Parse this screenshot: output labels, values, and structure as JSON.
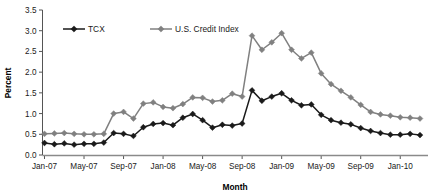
{
  "chart_data": {
    "type": "line",
    "title": "",
    "xlabel": "Month",
    "ylabel": "Percent",
    "ylim": [
      0.0,
      3.5
    ],
    "ytick_step": 0.5,
    "ytick_labels": [
      "0.0",
      "0.5",
      "1.0",
      "1.5",
      "2.0",
      "2.5",
      "3.0",
      "3.5"
    ],
    "grid": false,
    "legend_position": "top-left-inside",
    "x_tick_labels": [
      "Jan-07",
      "May-07",
      "Sep-07",
      "Jan-08",
      "May-08",
      "Sep-08",
      "Jan-09",
      "May-09",
      "Sep-09",
      "Jan-10"
    ],
    "x_tick_every_n_months": 4,
    "x": [
      "Jan-07",
      "Feb-07",
      "Mar-07",
      "Apr-07",
      "May-07",
      "Jun-07",
      "Jul-07",
      "Aug-07",
      "Sep-07",
      "Oct-07",
      "Nov-07",
      "Dec-07",
      "Jan-08",
      "Feb-08",
      "Mar-08",
      "Apr-08",
      "May-08",
      "Jun-08",
      "Jul-08",
      "Aug-08",
      "Sep-08",
      "Oct-08",
      "Nov-08",
      "Dec-08",
      "Jan-09",
      "Feb-09",
      "Mar-09",
      "Apr-09",
      "May-09",
      "Jun-09",
      "Jul-09",
      "Aug-09",
      "Sep-09",
      "Oct-09",
      "Nov-09",
      "Dec-09",
      "Jan-10",
      "Feb-10",
      "Mar-10"
    ],
    "series": [
      {
        "name": "TCX",
        "color": "#1a1a1a",
        "marker": "diamond",
        "values": [
          0.29,
          0.26,
          0.28,
          0.25,
          0.27,
          0.27,
          0.3,
          0.53,
          0.51,
          0.46,
          0.67,
          0.75,
          0.77,
          0.72,
          0.9,
          0.99,
          0.84,
          0.66,
          0.73,
          0.71,
          0.76,
          1.56,
          1.31,
          1.41,
          1.49,
          1.32,
          1.2,
          1.22,
          0.97,
          0.84,
          0.78,
          0.74,
          0.65,
          0.58,
          0.53,
          0.49,
          0.49,
          0.51,
          0.48
        ]
      },
      {
        "name": "U.S. Credit Index",
        "color": "#808080",
        "marker": "diamond",
        "values": [
          0.51,
          0.52,
          0.53,
          0.51,
          0.5,
          0.5,
          0.51,
          1.0,
          1.04,
          0.88,
          1.24,
          1.27,
          1.16,
          1.13,
          1.23,
          1.39,
          1.38,
          1.29,
          1.32,
          1.48,
          1.41,
          2.88,
          2.54,
          2.72,
          2.94,
          2.54,
          2.33,
          2.47,
          1.97,
          1.71,
          1.55,
          1.39,
          1.21,
          1.04,
          0.98,
          0.95,
          0.91,
          0.9,
          0.88
        ]
      }
    ]
  },
  "legend": {
    "items": [
      {
        "label": "TCX"
      },
      {
        "label": "U.S. Credit Index"
      }
    ]
  },
  "axes": {
    "y_title": "Percent",
    "x_title": "Month"
  }
}
